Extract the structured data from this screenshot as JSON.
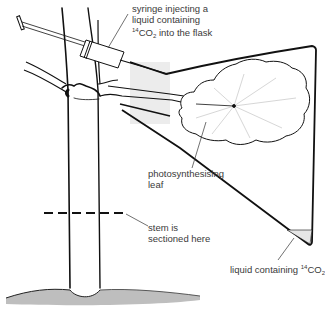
{
  "diagram": {
    "type": "experimental-setup",
    "colors": {
      "line": "#111111",
      "text": "#3a3a3a",
      "shade": "#ececec",
      "soil": "#555555",
      "background": "#ffffff"
    },
    "labels": {
      "syringe": {
        "line1": "syringe injecting a",
        "line2": "liquid containing",
        "line3_sup": "14",
        "line3_main": "CO",
        "line3_sub": "2",
        "line3_rest": " into the flask"
      },
      "leaf": {
        "line1": "photosynthesising",
        "line2": "leaf"
      },
      "stem": {
        "line1": "stem is",
        "line2": "sectioned here"
      },
      "liquid": {
        "prefix": "liquid containing ",
        "sup": "14",
        "main": "CO",
        "sub": "2"
      }
    },
    "parts": [
      "syringe",
      "flask",
      "photosynthesising-leaf",
      "branch",
      "tree-stem",
      "section-line",
      "soil",
      "liquid-in-flask"
    ]
  }
}
